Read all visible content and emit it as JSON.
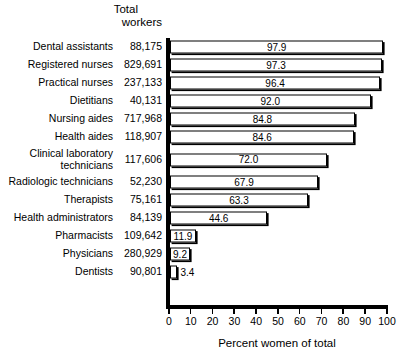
{
  "chart_data": {
    "type": "bar",
    "orientation": "horizontal",
    "title": "",
    "xlabel": "Percent women of total",
    "ylabel": "",
    "xlim": [
      0,
      100
    ],
    "xticks": [
      0,
      10,
      20,
      30,
      40,
      50,
      60,
      70,
      80,
      90,
      100
    ],
    "grid": false,
    "legend": false,
    "column_header": {
      "line1": "Total",
      "line2": "workers"
    },
    "categories": [
      "Dental assistants",
      "Registered nurses",
      "Practical nurses",
      "Dietitians",
      "Nursing aides",
      "Health aides",
      "Clinical laboratory technicians",
      "Radiologic technicians",
      "Therapists",
      "Health administrators",
      "Pharmacists",
      "Physicians",
      "Dentists"
    ],
    "category_lines": [
      [
        "Dental assistants"
      ],
      [
        "Registered nurses"
      ],
      [
        "Practical nurses"
      ],
      [
        "Dietitians"
      ],
      [
        "Nursing aides"
      ],
      [
        "Health aides"
      ],
      [
        "Clinical laboratory",
        "technicians"
      ],
      [
        "Radiologic technicians"
      ],
      [
        "Therapists"
      ],
      [
        "Health administrators"
      ],
      [
        "Pharmacists"
      ],
      [
        "Physicians"
      ],
      [
        "Dentists"
      ]
    ],
    "total_workers": [
      "88,175",
      "829,691",
      "237,133",
      "40,131",
      "717,968",
      "118,907",
      "117,606",
      "52,230",
      "75,161",
      "84,139",
      "109,642",
      "280,929",
      "90,801"
    ],
    "values": [
      97.9,
      97.3,
      96.4,
      92.0,
      84.8,
      84.6,
      72.0,
      67.9,
      63.3,
      44.6,
      11.9,
      9.2,
      3.4
    ],
    "value_labels": [
      "97.9",
      "97.3",
      "96.4",
      "92.0",
      "84.8",
      "84.6",
      "72.0",
      "67.9",
      "63.3",
      "44.6",
      "11.9",
      "9.2",
      "3.4"
    ],
    "label_inside": [
      true,
      true,
      true,
      true,
      true,
      true,
      true,
      true,
      true,
      true,
      true,
      true,
      false
    ],
    "colors": {
      "bar_fill": "#ffffff",
      "bar_edge": "#000000",
      "axis": "#000000",
      "text": "#000000",
      "background": "#ffffff"
    }
  }
}
